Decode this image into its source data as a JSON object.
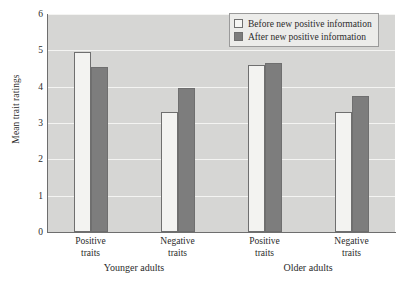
{
  "chart_data": {
    "type": "bar",
    "title": "",
    "xlabel": "",
    "ylabel": "Mean trait ratings",
    "ylim": [
      0,
      6
    ],
    "yticks": [
      "0",
      "1",
      "2",
      "3",
      "4",
      "5",
      "6"
    ],
    "grid": true,
    "legend_position": "top-right",
    "categories": [
      "Positive traits",
      "Negative traits",
      "Positive traits",
      "Negative traits"
    ],
    "category_lines": [
      [
        "Positive",
        "traits"
      ],
      [
        "Negative",
        "traits"
      ],
      [
        "Positive",
        "traits"
      ],
      [
        "Negative",
        "traits"
      ]
    ],
    "groups": [
      {
        "label": "Younger adults",
        "categories": [
          0,
          1
        ]
      },
      {
        "label": "Older adults",
        "categories": [
          2,
          3
        ]
      }
    ],
    "series": [
      {
        "name": "Before new positive information",
        "values": [
          4.95,
          3.3,
          4.6,
          3.3
        ],
        "color": "#f3f3f1"
      },
      {
        "name": "After new positive information",
        "values": [
          4.55,
          3.95,
          4.65,
          3.75
        ],
        "color": "#7d7d7d"
      }
    ]
  },
  "legend": {
    "items": [
      {
        "label": "Before new positive information"
      },
      {
        "label": "After new positive information"
      }
    ]
  },
  "top_caption": "",
  "colors": {
    "plot_background": "#d6d6d4",
    "gridline": "#f4f4f2",
    "axis": "#6e6e6e",
    "bar_before": "#f3f3f1",
    "bar_after": "#7d7d7d",
    "text": "#2b2b2b"
  }
}
